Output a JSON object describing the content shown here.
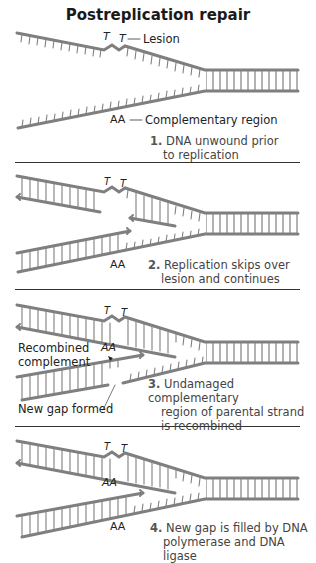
{
  "title": "Postreplication repair",
  "colors": {
    "strand": "#7f7f7f",
    "text": "#222222",
    "divider": "#333333"
  },
  "panels": [
    {
      "step_number": "1.",
      "step_line1": "DNA unwound prior",
      "step_line2": "to replication",
      "labels": {
        "lesion": "Lesion",
        "complementary": "Complementary region"
      },
      "lesion_bases": [
        "T",
        "T"
      ],
      "complement_bases": "AA"
    },
    {
      "step_number": "2.",
      "step_line1": "Replication skips over",
      "step_line2": "lesion and continues",
      "lesion_bases": [
        "T",
        "T"
      ],
      "complement_bases": "AA"
    },
    {
      "step_number": "3.",
      "step_line1": "Undamaged complementary",
      "step_line2": "region of parental strand",
      "step_line3": "is recombined",
      "labels": {
        "recombined_line1": "Recombined",
        "recombined_line2": "complement",
        "new_gap": "New gap formed"
      },
      "lesion_bases": [
        "T",
        "T"
      ],
      "complement_bases": "AA"
    },
    {
      "step_number": "4.",
      "step_line1": "New gap is filled by DNA",
      "step_line2": "polymerase and DNA ligase",
      "lesion_bases": [
        "T",
        "T"
      ],
      "complement_bases_upper": "AA",
      "complement_bases_lower": "AA"
    }
  ]
}
